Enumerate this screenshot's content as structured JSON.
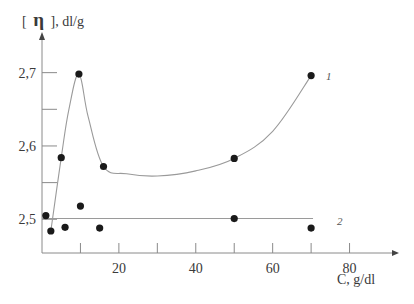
{
  "chart_data": {
    "type": "scatter",
    "title": "",
    "xlabel": "C, g/dl",
    "ylabel_prefix": "[",
    "ylabel_symbol": "η",
    "ylabel_suffix": "], dl/g",
    "xlim": [
      0,
      90
    ],
    "ylim": [
      2.454,
      2.75
    ],
    "x_ticks": [
      10,
      20,
      30,
      40,
      50,
      60,
      70,
      80
    ],
    "x_tick_labels": [
      {
        "value": 20,
        "label": "20"
      },
      {
        "value": 40,
        "label": "40"
      },
      {
        "value": 60,
        "label": "60"
      },
      {
        "value": 80,
        "label": "80"
      }
    ],
    "y_ticks": [
      2.5,
      2.55,
      2.6,
      2.65,
      2.7
    ],
    "y_tick_labels": [
      {
        "value": 2.5,
        "label": "2,5"
      },
      {
        "value": 2.6,
        "label": "2,6"
      },
      {
        "value": 2.7,
        "label": "2,7"
      }
    ],
    "grid": false,
    "points": [
      {
        "x": 1.0,
        "y": 2.505
      },
      {
        "x": 2.3,
        "y": 2.484
      },
      {
        "x": 5.0,
        "y": 2.584
      },
      {
        "x": 6.0,
        "y": 2.489
      },
      {
        "x": 9.6,
        "y": 2.698
      },
      {
        "x": 10.0,
        "y": 2.518
      },
      {
        "x": 15.0,
        "y": 2.488
      },
      {
        "x": 16.0,
        "y": 2.572
      },
      {
        "x": 50.0,
        "y": 2.583
      },
      {
        "x": 50.0,
        "y": 2.501
      },
      {
        "x": 70.0,
        "y": 2.696
      },
      {
        "x": 70.0,
        "y": 2.488
      }
    ],
    "series": [
      {
        "name": "1",
        "kind": "curve",
        "values": [
          {
            "x": 2.3,
            "y": 2.484
          },
          {
            "x": 5.0,
            "y": 2.584
          },
          {
            "x": 7.0,
            "y": 2.65
          },
          {
            "x": 9.6,
            "y": 2.698
          },
          {
            "x": 12.0,
            "y": 2.64
          },
          {
            "x": 16.0,
            "y": 2.572
          },
          {
            "x": 22.0,
            "y": 2.562
          },
          {
            "x": 30.0,
            "y": 2.559
          },
          {
            "x": 40.0,
            "y": 2.566
          },
          {
            "x": 50.0,
            "y": 2.583
          },
          {
            "x": 60.0,
            "y": 2.62
          },
          {
            "x": 70.0,
            "y": 2.696
          }
        ]
      },
      {
        "name": "2",
        "kind": "line",
        "values": [
          {
            "x": 0,
            "y": 2.501
          },
          {
            "x": 70.5,
            "y": 2.501
          }
        ]
      }
    ],
    "colors": {
      "points": "#1a1a1a",
      "curves": "#9a9a9a",
      "axes": "#8a8a8a",
      "text": "#3a3a3a"
    }
  }
}
